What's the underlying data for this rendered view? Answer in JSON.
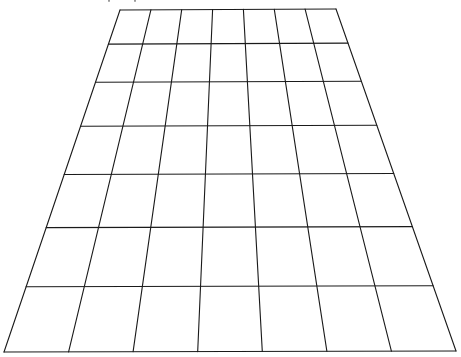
{
  "diagram": {
    "type": "perspective-grid",
    "columns": 7,
    "rows": 7,
    "line_color": "#1a1a1a",
    "background_color": "#ffffff",
    "top_caption_visible": false
  }
}
